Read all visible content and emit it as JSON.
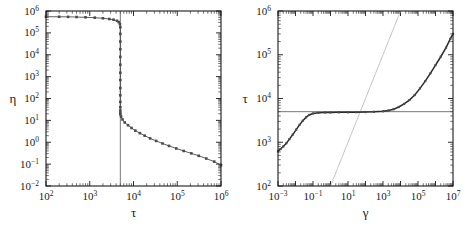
{
  "figure": {
    "panels": [
      "left",
      "right"
    ],
    "background": "#ffffff",
    "ink": "#1a1a1a"
  },
  "chart_data": [
    {
      "type": "line",
      "panel": "left",
      "title": "",
      "xlabel": "τ",
      "ylabel": "η",
      "xscale": "log",
      "yscale": "log",
      "xlim": [
        100,
        1000000
      ],
      "ylim": [
        0.01,
        1000000
      ],
      "xticks": [
        100,
        1000,
        10000,
        100000,
        1000000
      ],
      "xticklabels": [
        "10²",
        "10³",
        "10⁴",
        "10⁵",
        "10⁶"
      ],
      "yticks": [
        0.01,
        0.1,
        1,
        10,
        100,
        1000,
        10000,
        100000,
        1000000
      ],
      "yticklabels": [
        "10⁻²",
        "10⁻¹",
        "10⁰",
        "10¹",
        "10²",
        "10³",
        "10⁴",
        "10⁵",
        "10⁶"
      ],
      "grid": false,
      "legend": "none",
      "marker": "square",
      "annotations": [
        {
          "kind": "vertical-line",
          "x": 5000,
          "label": "critical stress τc ≈ 5×10³"
        }
      ],
      "series": [
        {
          "name": "η(τ)",
          "x": [
            100,
            200,
            320,
            500,
            800,
            1300,
            2000,
            2800,
            3500,
            4200,
            4600,
            4900,
            5000,
            5000,
            5000,
            5000,
            5000,
            5000,
            5000,
            5000,
            5000,
            5000,
            5000,
            5000,
            5000,
            5000,
            5000,
            5200,
            5600,
            6300,
            7500,
            9000,
            11000,
            14000,
            18000,
            24000,
            33000,
            46000,
            65000,
            95000,
            140000,
            210000,
            310000,
            460000,
            700000,
            1000000
          ],
          "y": [
            550000,
            545000,
            540000,
            530000,
            515000,
            495000,
            465000,
            430000,
            400000,
            355000,
            310000,
            250000,
            180000,
            90000,
            40000,
            18000,
            8000,
            3500,
            1500,
            700,
            300,
            140,
            70,
            40,
            28,
            22,
            19,
            15,
            11,
            8,
            6,
            4.5,
            3.4,
            2.6,
            2.0,
            1.5,
            1.15,
            0.88,
            0.68,
            0.52,
            0.4,
            0.31,
            0.24,
            0.18,
            0.13,
            0.09
          ]
        }
      ]
    },
    {
      "type": "line",
      "panel": "right",
      "title": "",
      "xlabel": "γ",
      "ylabel": "τ",
      "xscale": "log",
      "yscale": "log",
      "xlim": [
        0.001,
        10000000
      ],
      "ylim": [
        100,
        1000000
      ],
      "xticks": [
        0.001,
        0.1,
        10,
        1000,
        100000,
        10000000
      ],
      "xticklabels": [
        "10⁻³",
        "10⁻¹",
        "10¹",
        "10³",
        "10⁵",
        "10⁷"
      ],
      "yticks": [
        100,
        1000,
        10000,
        100000,
        1000000
      ],
      "yticklabels": [
        "10²",
        "10³",
        "10⁴",
        "10⁵",
        "10⁶"
      ],
      "grid": false,
      "legend": "none",
      "marker": "square",
      "annotations": [
        {
          "kind": "horizontal-line",
          "y": 5000,
          "label": "yield stress plateau τy ≈ 5×10³"
        },
        {
          "kind": "diagonal-line",
          "slope": 1,
          "through": [
            1,
            100
          ],
          "label": "Newtonian asymptote τ ∝ γ"
        }
      ],
      "series": [
        {
          "name": "τ(γ)",
          "x": [
            0.001,
            0.0014,
            0.002,
            0.003,
            0.0045,
            0.007,
            0.011,
            0.017,
            0.026,
            0.04,
            0.06,
            0.1,
            0.2,
            0.5,
            1,
            3,
            10,
            30,
            100,
            300,
            1000,
            2000,
            4000,
            8000,
            16000,
            32000,
            65000,
            130000,
            260000,
            520000,
            1000000,
            2000000,
            4000000,
            7000000,
            10000000
          ],
          "y": [
            620,
            700,
            800,
            950,
            1180,
            1500,
            1950,
            2500,
            3100,
            3700,
            4200,
            4550,
            4700,
            4780,
            4800,
            4820,
            4840,
            4860,
            4900,
            4960,
            5100,
            5300,
            5700,
            6400,
            7500,
            9200,
            12000,
            17000,
            25000,
            38000,
            58000,
            90000,
            145000,
            230000,
            300000
          ]
        }
      ]
    }
  ]
}
